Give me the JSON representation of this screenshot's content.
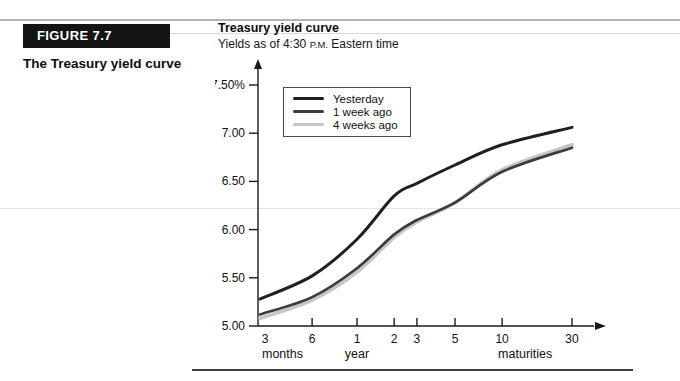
{
  "sidebar": {
    "figure_label": "FIGURE 7.7",
    "figure_caption": "The Treasury yield curve"
  },
  "chart": {
    "title": "Treasury yield curve",
    "subtitle_prefix": "Yields as of 4:30 ",
    "subtitle_smallcaps": "P.M.",
    "subtitle_suffix": " Eastern time"
  },
  "chart_data": {
    "type": "line",
    "title": "Treasury yield curve",
    "subtitle": "Yields as of 4:30 P.M. Eastern time",
    "categories": [
      "3 months",
      "6 months",
      "1 year",
      "2 years",
      "3 years",
      "5 years",
      "10 years",
      "30 years"
    ],
    "x_tick_labels": [
      "3",
      "6",
      "1",
      "2",
      "3",
      "5",
      "10",
      "30"
    ],
    "x_axis_sublabels": [
      {
        "text": "months",
        "index": 0
      },
      {
        "text": "year",
        "index": 2
      },
      {
        "text": "maturities",
        "index": 6
      }
    ],
    "xlabel": "maturities",
    "ylabel": "",
    "y_tick_labels": [
      "7.50%",
      "7.00",
      "6.50",
      "6.00",
      "5.50",
      "5.00"
    ],
    "y_tick_values": [
      7.5,
      7.0,
      6.5,
      6.0,
      5.5,
      5.0
    ],
    "ylim": [
      5.0,
      7.5
    ],
    "x_positions_norm": [
      0,
      0.167,
      0.311,
      0.43,
      0.503,
      0.625,
      0.776,
      1.0
    ],
    "grid": false,
    "legend_position": "top-left-inside",
    "series": [
      {
        "name": "Yesterday",
        "color": "#1f1f1f",
        "values": [
          5.28,
          5.52,
          5.9,
          6.35,
          6.48,
          6.67,
          6.88,
          7.06
        ]
      },
      {
        "name": "1 week ago",
        "color": "#3c3c3c",
        "values": [
          5.12,
          5.3,
          5.6,
          5.95,
          6.1,
          6.28,
          6.6,
          6.85
        ]
      },
      {
        "name": "4 weeks ago",
        "color": "#c6c6c6",
        "values": [
          5.08,
          5.27,
          5.56,
          5.92,
          6.08,
          6.28,
          6.62,
          6.88
        ]
      }
    ]
  }
}
